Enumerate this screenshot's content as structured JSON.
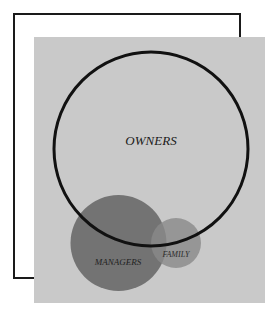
{
  "diagram": {
    "type": "venn",
    "colors": {
      "background": "#ffffff",
      "frame": "#1a1a1a",
      "panel": "#c9c9c9",
      "owners_outline": "#111111",
      "managers_fill": "#6b6b6b",
      "family_fill": "#8c8c8c"
    },
    "sets": [
      {
        "id": "owners",
        "label": "OWNERS"
      },
      {
        "id": "managers",
        "label": "MANAGERS"
      },
      {
        "id": "family",
        "label": "FAMILY"
      }
    ]
  }
}
